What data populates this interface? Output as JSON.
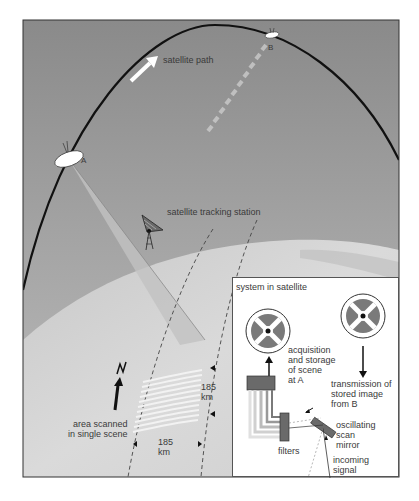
{
  "diagram": {
    "labels": {
      "satellite_path": "satellite path",
      "point_a": "A",
      "point_b": "B",
      "tracking_station": "satellite tracking station",
      "north": "N",
      "area_scanned": "area scanned\nin single scene",
      "width_km_v": "185\nkm",
      "width_km_h": "185\nkm"
    },
    "inset": {
      "title": "system in satellite",
      "acquisition": "acquisition\nand storage\nof scene\nat A",
      "transmission": "transmission of\nstored image\nfrom B",
      "mirror": "oscillating\nscan\nmirror",
      "filters": "filters",
      "incoming": "incoming\nsignal"
    },
    "colors": {
      "sky": "#8e8e8e",
      "earth": "#d4d4d4",
      "orbit": "#111111",
      "inset_bg": "#ffffff",
      "reel_gray": "#7a7a7a"
    }
  }
}
